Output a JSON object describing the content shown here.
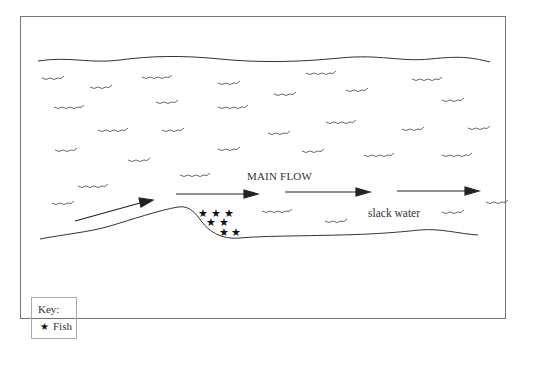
{
  "diagram": {
    "type": "river-flow-schematic",
    "labels": {
      "main_flow": "MAIN FLOW",
      "slack_water": "slack water"
    },
    "key": {
      "title": "Key:",
      "items": [
        {
          "symbol": "star-icon",
          "glyph": "★",
          "label": "Fish"
        }
      ]
    },
    "fish_count": 7,
    "flow_arrows": 4,
    "colors": {
      "line": "#333333",
      "frame": "#777777",
      "background": "#ffffff"
    }
  }
}
